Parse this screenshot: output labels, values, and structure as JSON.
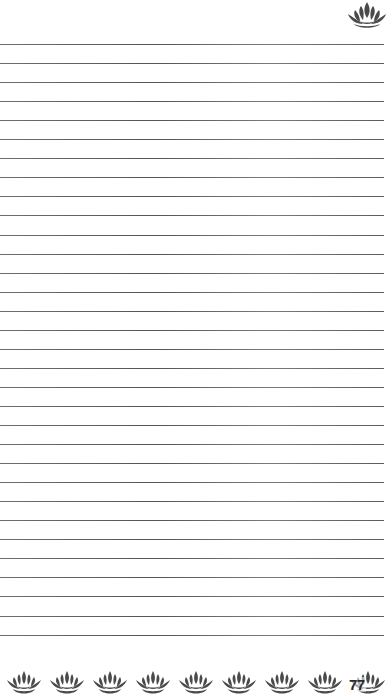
{
  "page": {
    "background_color": "#ffffff",
    "line_color": "#5f5f5f",
    "ornament_color": "#4a4a4a",
    "page_number": "77"
  },
  "ruled_lines": {
    "count": 32,
    "first_y": 44,
    "spacing": 19.05,
    "x_start": 0,
    "x_end": 384
  },
  "ornaments": {
    "top": {
      "icon": "lotus-icon",
      "count": 1
    },
    "bottom": {
      "icon": "lotus-icon",
      "count": 9,
      "start_x": 6,
      "spacing": 43
    }
  }
}
